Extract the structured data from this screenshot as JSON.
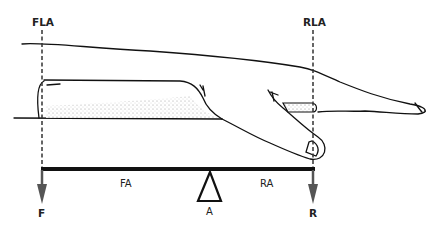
{
  "diagram": {
    "type": "lever-mechanics-hand",
    "labels": {
      "force_line_axis": "FLA",
      "resistance_line_axis": "RLA",
      "force_arm": "FA",
      "resistance_arm": "RA",
      "force": "F",
      "axis": "A",
      "resistance": "R"
    },
    "colors": {
      "line": "#111111",
      "arrow": "#555555",
      "shading": "#bbbbbb",
      "background": "#ffffff"
    }
  }
}
